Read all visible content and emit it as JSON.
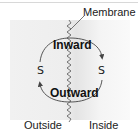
{
  "diagram": {
    "membrane_label": "Membrane",
    "inward_label": "Inward",
    "outward_label": "Outward",
    "substrate_left": "S",
    "substrate_right": "S",
    "outside_label": "Outside",
    "inside_label": "Inside"
  },
  "colors": {
    "text": "#222222",
    "arrow": "#444444",
    "panel_background": "#eeeeee",
    "membrane_line": "#555555"
  }
}
